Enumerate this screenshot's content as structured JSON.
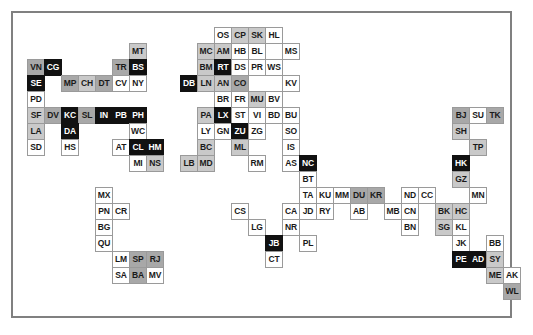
{
  "legend": {
    "shades": {
      "white": "#ffffff",
      "light": "#c9c9c9",
      "mid": "#a8a8a8",
      "black": "#111111"
    },
    "border_color": "#808080",
    "cell_border_color": "#9a9a9a"
  },
  "grid": {
    "cell_width": 18,
    "cell_height": 17,
    "col_width": 17,
    "row_height": 16,
    "origin_x": 14,
    "origin_y": 14
  },
  "chart_data": {
    "type": "heatmap",
    "title": "",
    "xlabel": "",
    "ylabel": "",
    "note": "Cartogram-style tile grid map; each tile is a 2-letter region code shaded by category",
    "shade_categories": [
      "white",
      "light",
      "mid",
      "black"
    ],
    "cells": [
      {
        "label": "OS",
        "col": 11,
        "row": 0,
        "shade": "white"
      },
      {
        "label": "CP",
        "col": 12,
        "row": 0,
        "shade": "light"
      },
      {
        "label": "SK",
        "col": 13,
        "row": 0,
        "shade": "light"
      },
      {
        "label": "HL",
        "col": 14,
        "row": 0,
        "shade": "white"
      },
      {
        "label": "MC",
        "col": 10,
        "row": 1,
        "shade": "light"
      },
      {
        "label": "AM",
        "col": 11,
        "row": 1,
        "shade": "light"
      },
      {
        "label": "HB",
        "col": 12,
        "row": 1,
        "shade": "white"
      },
      {
        "label": "BL",
        "col": 13,
        "row": 1,
        "shade": "white"
      },
      {
        "label": "MS",
        "col": 15,
        "row": 1,
        "shade": "white"
      },
      {
        "label": "BM",
        "col": 10,
        "row": 2,
        "shade": "light"
      },
      {
        "label": "RT",
        "col": 11,
        "row": 2,
        "shade": "black"
      },
      {
        "label": "DS",
        "col": 12,
        "row": 2,
        "shade": "white"
      },
      {
        "label": "PR",
        "col": 13,
        "row": 2,
        "shade": "white"
      },
      {
        "label": "WS",
        "col": 14,
        "row": 2,
        "shade": "white"
      },
      {
        "label": "DB",
        "col": 9,
        "row": 3,
        "shade": "black"
      },
      {
        "label": "LN",
        "col": 10,
        "row": 3,
        "shade": "light"
      },
      {
        "label": "AN",
        "col": 11,
        "row": 3,
        "shade": "light"
      },
      {
        "label": "CO",
        "col": 12,
        "row": 3,
        "shade": "mid"
      },
      {
        "label": "KV",
        "col": 15,
        "row": 3,
        "shade": "white"
      },
      {
        "label": "BR",
        "col": 11,
        "row": 4,
        "shade": "white"
      },
      {
        "label": "FR",
        "col": 12,
        "row": 4,
        "shade": "white"
      },
      {
        "label": "MU",
        "col": 13,
        "row": 4,
        "shade": "light"
      },
      {
        "label": "BV",
        "col": 14,
        "row": 4,
        "shade": "white"
      },
      {
        "label": "PA",
        "col": 10,
        "row": 5,
        "shade": "light"
      },
      {
        "label": "LX",
        "col": 11,
        "row": 5,
        "shade": "black"
      },
      {
        "label": "ST",
        "col": 12,
        "row": 5,
        "shade": "white"
      },
      {
        "label": "VI",
        "col": 13,
        "row": 5,
        "shade": "white"
      },
      {
        "label": "BD",
        "col": 14,
        "row": 5,
        "shade": "white"
      },
      {
        "label": "BU",
        "col": 15,
        "row": 5,
        "shade": "white"
      },
      {
        "label": "LY",
        "col": 10,
        "row": 6,
        "shade": "white"
      },
      {
        "label": "GN",
        "col": 11,
        "row": 6,
        "shade": "white"
      },
      {
        "label": "ZU",
        "col": 12,
        "row": 6,
        "shade": "black"
      },
      {
        "label": "ZG",
        "col": 13,
        "row": 6,
        "shade": "white"
      },
      {
        "label": "SO",
        "col": 15,
        "row": 6,
        "shade": "white"
      },
      {
        "label": "BC",
        "col": 10,
        "row": 7,
        "shade": "light"
      },
      {
        "label": "ML",
        "col": 12,
        "row": 7,
        "shade": "light"
      },
      {
        "label": "IS",
        "col": 15,
        "row": 7,
        "shade": "white"
      },
      {
        "label": "LB",
        "col": 9,
        "row": 8,
        "shade": "light"
      },
      {
        "label": "MD",
        "col": 10,
        "row": 8,
        "shade": "light"
      },
      {
        "label": "RM",
        "col": 13,
        "row": 8,
        "shade": "white"
      },
      {
        "label": "AS",
        "col": 15,
        "row": 8,
        "shade": "white"
      },
      {
        "label": "NC",
        "col": 16,
        "row": 8,
        "shade": "black"
      },
      {
        "label": "BT",
        "col": 16,
        "row": 9,
        "shade": "white"
      },
      {
        "label": "TA",
        "col": 16,
        "row": 10,
        "shade": "white"
      },
      {
        "label": "KU",
        "col": 17,
        "row": 10,
        "shade": "white"
      },
      {
        "label": "MM",
        "col": 18,
        "row": 10,
        "shade": "white"
      },
      {
        "label": "DU",
        "col": 19,
        "row": 10,
        "shade": "mid"
      },
      {
        "label": "KR",
        "col": 20,
        "row": 10,
        "shade": "mid"
      },
      {
        "label": "ND",
        "col": 22,
        "row": 10,
        "shade": "white"
      },
      {
        "label": "CC",
        "col": 23,
        "row": 10,
        "shade": "white"
      },
      {
        "label": "CS",
        "col": 12,
        "row": 11,
        "shade": "white"
      },
      {
        "label": "CA",
        "col": 15,
        "row": 11,
        "shade": "white"
      },
      {
        "label": "JD",
        "col": 16,
        "row": 11,
        "shade": "white"
      },
      {
        "label": "RY",
        "col": 17,
        "row": 11,
        "shade": "white"
      },
      {
        "label": "AB",
        "col": 19,
        "row": 11,
        "shade": "white"
      },
      {
        "label": "MB",
        "col": 21,
        "row": 11,
        "shade": "white"
      },
      {
        "label": "CN",
        "col": 22,
        "row": 11,
        "shade": "white"
      },
      {
        "label": "LG",
        "col": 13,
        "row": 12,
        "shade": "white"
      },
      {
        "label": "NR",
        "col": 15,
        "row": 12,
        "shade": "white"
      },
      {
        "label": "BN",
        "col": 22,
        "row": 12,
        "shade": "white"
      },
      {
        "label": "JB",
        "col": 14,
        "row": 13,
        "shade": "black"
      },
      {
        "label": "PL",
        "col": 16,
        "row": 13,
        "shade": "white"
      },
      {
        "label": "CT",
        "col": 14,
        "row": 14,
        "shade": "white"
      },
      {
        "label": "MT",
        "col": 6,
        "row": 1,
        "shade": "light"
      },
      {
        "label": "VN",
        "col": 0,
        "row": 2,
        "shade": "mid"
      },
      {
        "label": "CG",
        "col": 1,
        "row": 2,
        "shade": "black"
      },
      {
        "label": "TR",
        "col": 5,
        "row": 2,
        "shade": "mid"
      },
      {
        "label": "BS",
        "col": 6,
        "row": 2,
        "shade": "black"
      },
      {
        "label": "SE",
        "col": 0,
        "row": 3,
        "shade": "black"
      },
      {
        "label": "MP",
        "col": 2,
        "row": 3,
        "shade": "mid"
      },
      {
        "label": "CH",
        "col": 3,
        "row": 3,
        "shade": "light"
      },
      {
        "label": "DT",
        "col": 4,
        "row": 3,
        "shade": "mid"
      },
      {
        "label": "CV",
        "col": 5,
        "row": 3,
        "shade": "white"
      },
      {
        "label": "NY",
        "col": 6,
        "row": 3,
        "shade": "white"
      },
      {
        "label": "PD",
        "col": 0,
        "row": 4,
        "shade": "white"
      },
      {
        "label": "SF",
        "col": 0,
        "row": 5,
        "shade": "light"
      },
      {
        "label": "DV",
        "col": 1,
        "row": 5,
        "shade": "mid"
      },
      {
        "label": "KC",
        "col": 2,
        "row": 5,
        "shade": "black"
      },
      {
        "label": "SL",
        "col": 3,
        "row": 5,
        "shade": "mid"
      },
      {
        "label": "IN",
        "col": 4,
        "row": 5,
        "shade": "black"
      },
      {
        "label": "PB",
        "col": 5,
        "row": 5,
        "shade": "black"
      },
      {
        "label": "PH",
        "col": 6,
        "row": 5,
        "shade": "black"
      },
      {
        "label": "LA",
        "col": 0,
        "row": 6,
        "shade": "light"
      },
      {
        "label": "DA",
        "col": 2,
        "row": 6,
        "shade": "black"
      },
      {
        "label": "WC",
        "col": 6,
        "row": 6,
        "shade": "white"
      },
      {
        "label": "SD",
        "col": 0,
        "row": 7,
        "shade": "white"
      },
      {
        "label": "HS",
        "col": 2,
        "row": 7,
        "shade": "white"
      },
      {
        "label": "AT",
        "col": 5,
        "row": 7,
        "shade": "white"
      },
      {
        "label": "CL",
        "col": 6,
        "row": 7,
        "shade": "black"
      },
      {
        "label": "HM",
        "col": 7,
        "row": 7,
        "shade": "black"
      },
      {
        "label": "MI",
        "col": 6,
        "row": 8,
        "shade": "white"
      },
      {
        "label": "NS",
        "col": 7,
        "row": 8,
        "shade": "light"
      },
      {
        "label": "MX",
        "col": 4,
        "row": 10,
        "shade": "white"
      },
      {
        "label": "PN",
        "col": 4,
        "row": 11,
        "shade": "white"
      },
      {
        "label": "CR",
        "col": 5,
        "row": 11,
        "shade": "white"
      },
      {
        "label": "BG",
        "col": 4,
        "row": 12,
        "shade": "white"
      },
      {
        "label": "QU",
        "col": 4,
        "row": 13,
        "shade": "white"
      },
      {
        "label": "LM",
        "col": 5,
        "row": 14,
        "shade": "white"
      },
      {
        "label": "SP",
        "col": 6,
        "row": 14,
        "shade": "mid"
      },
      {
        "label": "RJ",
        "col": 7,
        "row": 14,
        "shade": "mid"
      },
      {
        "label": "SA",
        "col": 5,
        "row": 15,
        "shade": "white"
      },
      {
        "label": "BA",
        "col": 6,
        "row": 15,
        "shade": "mid"
      },
      {
        "label": "MV",
        "col": 7,
        "row": 15,
        "shade": "white"
      },
      {
        "label": "BJ",
        "col": 25,
        "row": 5,
        "shade": "mid"
      },
      {
        "label": "SU",
        "col": 26,
        "row": 5,
        "shade": "white"
      },
      {
        "label": "TK",
        "col": 27,
        "row": 5,
        "shade": "mid"
      },
      {
        "label": "SH",
        "col": 25,
        "row": 6,
        "shade": "light"
      },
      {
        "label": "TP",
        "col": 26,
        "row": 7,
        "shade": "light"
      },
      {
        "label": "HK",
        "col": 25,
        "row": 8,
        "shade": "black"
      },
      {
        "label": "GZ",
        "col": 25,
        "row": 9,
        "shade": "light"
      },
      {
        "label": "MN",
        "col": 26,
        "row": 10,
        "shade": "white"
      },
      {
        "label": "BK",
        "col": 24,
        "row": 11,
        "shade": "light"
      },
      {
        "label": "HC",
        "col": 25,
        "row": 11,
        "shade": "light"
      },
      {
        "label": "SG",
        "col": 24,
        "row": 12,
        "shade": "light"
      },
      {
        "label": "KL",
        "col": 25,
        "row": 12,
        "shade": "white"
      },
      {
        "label": "JK",
        "col": 25,
        "row": 13,
        "shade": "white"
      },
      {
        "label": "BB",
        "col": 27,
        "row": 13,
        "shade": "white"
      },
      {
        "label": "PE",
        "col": 25,
        "row": 14,
        "shade": "black"
      },
      {
        "label": "AD",
        "col": 26,
        "row": 14,
        "shade": "black"
      },
      {
        "label": "SY",
        "col": 27,
        "row": 14,
        "shade": "light"
      },
      {
        "label": "ME",
        "col": 27,
        "row": 15,
        "shade": "light"
      },
      {
        "label": "AK",
        "col": 28,
        "row": 15,
        "shade": "white"
      },
      {
        "label": "WL",
        "col": 28,
        "row": 16,
        "shade": "mid"
      }
    ]
  }
}
